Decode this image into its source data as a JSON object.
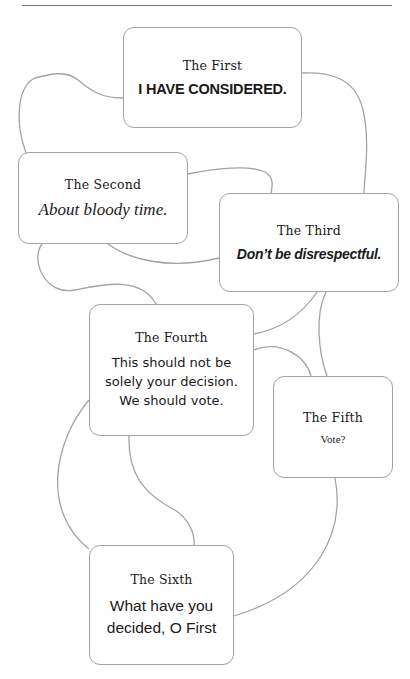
{
  "diagram": {
    "type": "flow-of-speakers",
    "colors": {
      "stroke": "#a3a3a3",
      "text": "#1a1a1a",
      "background": "#ffffff",
      "rule": "#777777"
    },
    "nodes": [
      {
        "id": "first",
        "title": "The First",
        "message": "I HAVE CONSIDERED."
      },
      {
        "id": "second",
        "title": "The Second",
        "message": "About bloody time."
      },
      {
        "id": "third",
        "title": "The Third",
        "message": "Don’t be disrespectful."
      },
      {
        "id": "fourth",
        "title": "The Fourth",
        "message_lines": [
          "This should not be",
          "solely your decision.",
          "We should vote."
        ]
      },
      {
        "id": "fifth",
        "title": "The Fifth",
        "message": "Vote?"
      },
      {
        "id": "sixth",
        "title": "The Sixth",
        "message_lines": [
          "What have you",
          "decided, O First"
        ]
      }
    ],
    "edges": [
      [
        "first",
        "second"
      ],
      [
        "first",
        "third"
      ],
      [
        "second",
        "third"
      ],
      [
        "second",
        "fourth"
      ],
      [
        "third",
        "fourth"
      ],
      [
        "third",
        "fifth"
      ],
      [
        "fourth",
        "fifth"
      ],
      [
        "fourth",
        "sixth"
      ],
      [
        "fifth",
        "sixth"
      ]
    ]
  }
}
